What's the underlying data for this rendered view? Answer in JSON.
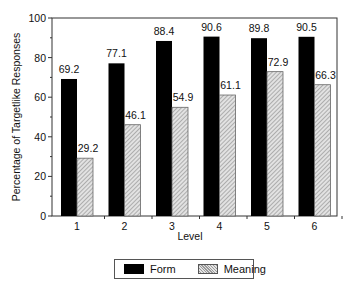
{
  "chart_data": {
    "type": "bar",
    "title": "",
    "xlabel": "Level",
    "ylabel": "Percentage of Targetlike Responses",
    "categories": [
      "1",
      "2",
      "3",
      "4",
      "5",
      "6"
    ],
    "series": [
      {
        "name": "Form",
        "values": [
          69.2,
          77.1,
          88.4,
          90.6,
          89.8,
          90.5
        ],
        "color": "#000000"
      },
      {
        "name": "Meaning",
        "values": [
          29.2,
          46.1,
          54.9,
          61.1,
          72.9,
          66.3
        ],
        "color": "#cccccc",
        "pattern": "diagonal-hatch"
      }
    ],
    "ylim": [
      0,
      100
    ],
    "yticks": [
      0,
      20,
      40,
      60,
      80,
      100
    ],
    "data_labels": true,
    "grid": false,
    "legend_position": "bottom"
  },
  "legend": {
    "items": [
      {
        "label": "Form"
      },
      {
        "label": "Meaning"
      }
    ]
  }
}
